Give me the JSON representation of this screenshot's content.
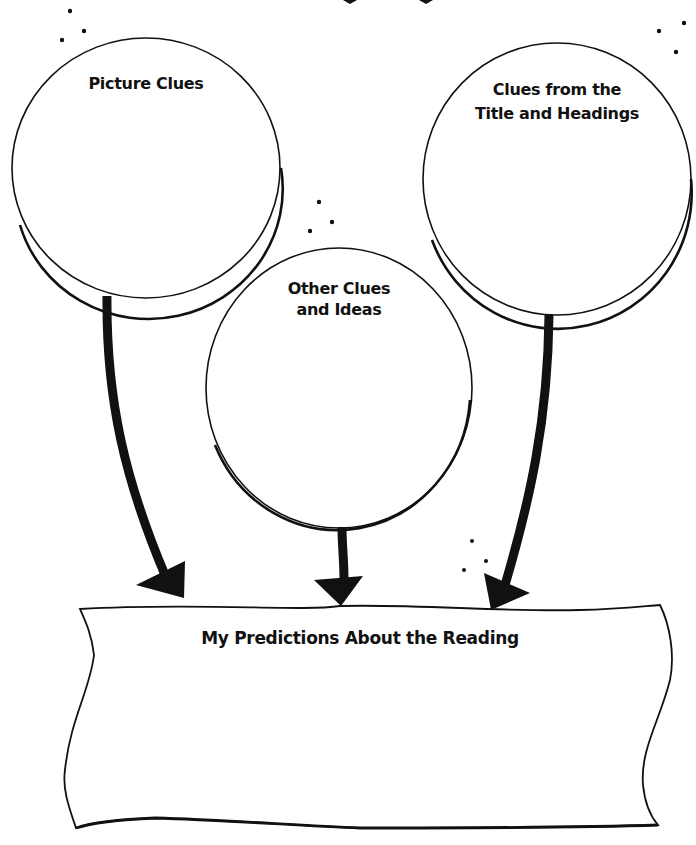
{
  "diagram": {
    "type": "prediction-graphic-organizer",
    "colors": {
      "ink": "#111111",
      "background": "#ffffff"
    },
    "circles": [
      {
        "id": "picture-clues",
        "label": "Picture Clues",
        "lines": [
          "Picture Clues"
        ]
      },
      {
        "id": "other-clues",
        "label": "Other Clues and Ideas",
        "lines": [
          "Other Clues",
          "and Ideas"
        ]
      },
      {
        "id": "title-clues",
        "label": "Clues from the Title and Headings",
        "lines": [
          "Clues from the",
          "Title and Headings"
        ]
      }
    ],
    "banner": {
      "label": "My Predictions About the Reading"
    },
    "arrows": [
      {
        "from": "picture-clues",
        "to": "banner"
      },
      {
        "from": "other-clues",
        "to": "banner"
      },
      {
        "from": "title-clues",
        "to": "banner"
      }
    ]
  }
}
